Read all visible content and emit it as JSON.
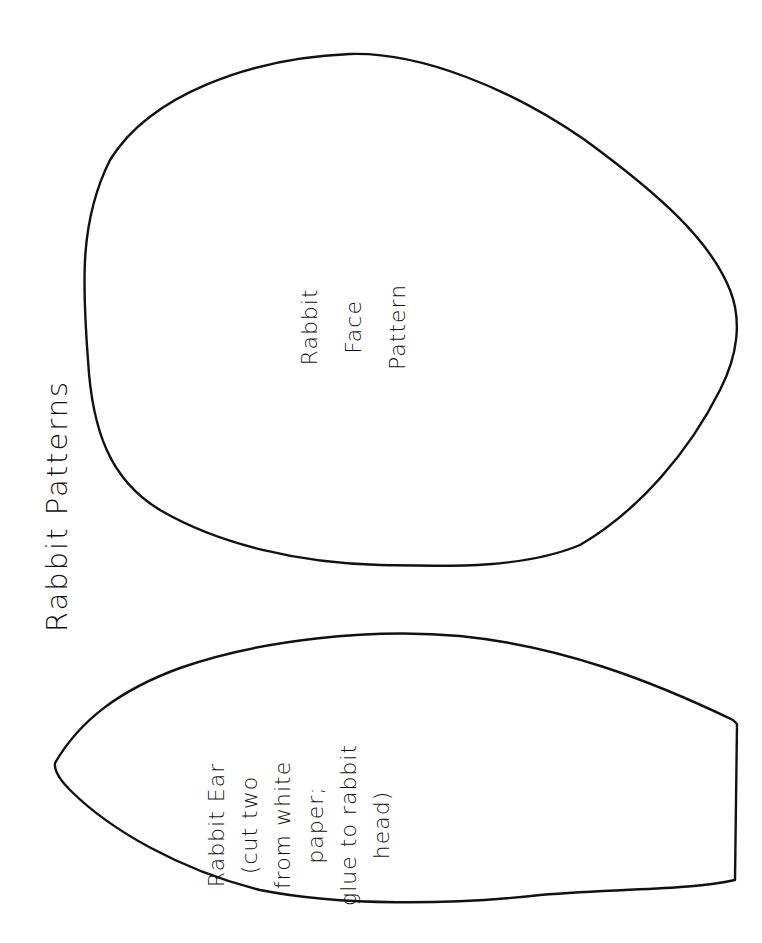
{
  "page": {
    "title": "Rabbit Patterns",
    "background": "#ffffff",
    "ink_color": "#111111"
  },
  "face_pattern": {
    "shape": "egg-outline",
    "label_lines": [
      "Rabbit",
      "Face",
      "Pattern"
    ]
  },
  "ear_pattern": {
    "shape": "leaf-outline-with-flat-base",
    "label_lines": [
      "Rabbit Ear",
      "(cut two",
      "from white",
      "paper;",
      "glue to rabbit",
      "head)"
    ]
  }
}
